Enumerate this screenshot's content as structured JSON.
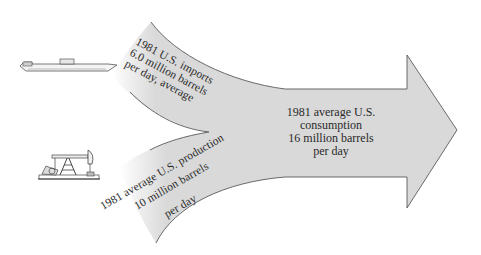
{
  "diagram": {
    "type": "flow-arrow",
    "colors": {
      "arrow_fill": "#d9d9d9",
      "arrow_stroke": "#5a5a5a",
      "text": "#2a2a2a",
      "background": "#ffffff"
    },
    "imports": {
      "icon": "oil-tanker-ship-icon",
      "lines": [
        "1981 U.S. imports",
        "6.0 million barrels",
        "per day, average"
      ]
    },
    "production": {
      "icon": "oil-pump-jack-icon",
      "lines": [
        "1981 average U.S. production",
        "10 million barrels",
        "per day"
      ]
    },
    "consumption": {
      "lines": [
        "1981 average U.S.",
        "consumption",
        "16 million barrels",
        "per day"
      ]
    }
  }
}
